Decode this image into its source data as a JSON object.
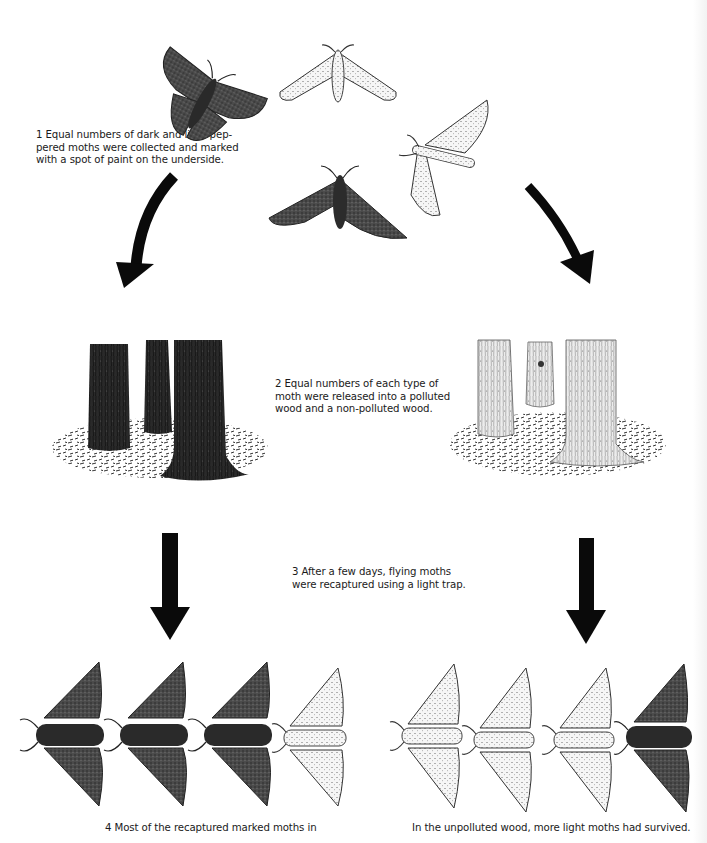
{
  "diagram": {
    "steps": [
      {
        "number": "1",
        "text_lines": [
          "1 Equal numbers of dark and light pep-",
          "pered moths were collected and marked",
          "with a spot of paint on the underside."
        ]
      },
      {
        "number": "2",
        "text_lines": [
          "2 Equal numbers of each type of",
          "moth were released into a polluted",
          "wood and a non-polluted wood."
        ]
      },
      {
        "number": "3",
        "text_lines": [
          "3 After a few days, flying moths",
          "were recaptured using a light trap."
        ]
      },
      {
        "number": "4",
        "text_lines": [
          "4 Most of the recaptured marked moths in"
        ]
      }
    ],
    "conclusion_right": "In the unpolluted wood, more light moths had survived.",
    "initial_moths": [
      "dark",
      "light",
      "light",
      "dark"
    ],
    "woods": [
      {
        "label": "polluted-wood",
        "bark": "dark"
      },
      {
        "label": "non-polluted-wood",
        "bark": "light"
      }
    ],
    "recaptured": {
      "polluted_wood": [
        "dark",
        "dark",
        "dark",
        "light"
      ],
      "unpolluted_wood": [
        "light",
        "light",
        "light",
        "dark"
      ]
    },
    "colors": {
      "dark_moth": "#3a3a3a",
      "light_moth": "#f4f4f4",
      "arrow": "#0a0a0a",
      "dark_bark": "#262626",
      "light_bark": "#e6e6e6"
    }
  }
}
